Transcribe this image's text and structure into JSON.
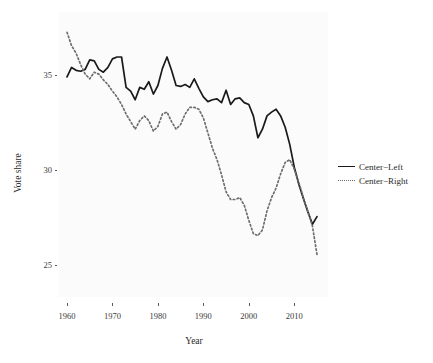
{
  "chart_data": {
    "type": "line",
    "title": "",
    "xlabel": "Year",
    "ylabel": "Vote share",
    "xlim": [
      1958,
      2016
    ],
    "ylim": [
      24.2,
      37.6
    ],
    "grid": false,
    "legend_position": "right",
    "xticks": [
      1960,
      1970,
      1980,
      1990,
      2000,
      2010
    ],
    "xtick_labels": [
      "1960",
      "1970",
      "1980",
      "1990",
      "2000",
      "2010"
    ],
    "yticks": [
      25,
      30,
      35
    ],
    "ytick_labels": [
      "25",
      "30",
      "35"
    ],
    "series": [
      {
        "name": "Center−Left",
        "style": "solid",
        "color": "#1a1a1a",
        "x": [
          1960,
          1961,
          1962,
          1963,
          1964,
          1965,
          1966,
          1967,
          1968,
          1969,
          1970,
          1971,
          1972,
          1973,
          1974,
          1975,
          1976,
          1977,
          1978,
          1979,
          1980,
          1981,
          1982,
          1983,
          1984,
          1985,
          1986,
          1987,
          1988,
          1989,
          1990,
          1991,
          1992,
          1993,
          1994,
          1995,
          1996,
          1997,
          1998,
          1999,
          2000,
          2001,
          2002,
          2003,
          2004,
          2005,
          2006,
          2007,
          2008,
          2009,
          2010,
          2011,
          2012,
          2013,
          2014,
          2015
        ],
        "y": [
          34.95,
          35.45,
          35.3,
          35.25,
          35.35,
          35.85,
          35.8,
          35.35,
          35.2,
          35.45,
          35.9,
          36.0,
          36.0,
          34.4,
          34.2,
          33.75,
          34.4,
          34.3,
          34.7,
          34.05,
          34.5,
          35.4,
          36.0,
          35.3,
          34.5,
          34.45,
          34.55,
          34.4,
          34.85,
          34.35,
          33.9,
          33.65,
          33.75,
          33.8,
          33.6,
          34.25,
          33.5,
          33.8,
          33.85,
          33.6,
          33.5,
          32.9,
          31.75,
          32.2,
          32.9,
          33.1,
          33.25,
          32.9,
          32.3,
          31.4,
          30.2,
          29.3,
          28.55,
          27.85,
          27.2,
          27.6
        ]
      },
      {
        "name": "Center−Right",
        "style": "dotted",
        "color": "#6e6e6e",
        "x": [
          1960,
          1961,
          1962,
          1963,
          1964,
          1965,
          1966,
          1967,
          1968,
          1969,
          1970,
          1971,
          1972,
          1973,
          1974,
          1975,
          1976,
          1977,
          1978,
          1979,
          1980,
          1981,
          1982,
          1983,
          1984,
          1985,
          1986,
          1987,
          1988,
          1989,
          1990,
          1991,
          1992,
          1993,
          1994,
          1995,
          1996,
          1997,
          1998,
          1999,
          2000,
          2001,
          2002,
          2003,
          2004,
          2005,
          2006,
          2007,
          2008,
          2009,
          2010,
          2011,
          2012,
          2013,
          2014,
          2015
        ],
        "y": [
          37.3,
          36.6,
          36.2,
          35.6,
          35.1,
          34.85,
          35.2,
          35.1,
          34.8,
          34.55,
          34.2,
          33.9,
          33.5,
          33.0,
          32.6,
          32.2,
          32.65,
          32.9,
          32.65,
          32.1,
          32.35,
          33.0,
          33.1,
          32.6,
          32.2,
          32.45,
          33.0,
          33.35,
          33.35,
          33.25,
          32.8,
          32.0,
          31.2,
          30.6,
          29.8,
          28.9,
          28.5,
          28.5,
          28.6,
          28.2,
          27.4,
          26.7,
          26.6,
          26.9,
          27.9,
          28.6,
          29.1,
          29.85,
          30.45,
          30.6,
          30.1,
          29.4,
          28.6,
          27.85,
          27.1,
          25.6
        ]
      }
    ]
  },
  "legend": {
    "items": [
      {
        "label": "Center−Left",
        "style": "solid"
      },
      {
        "label": "Center−Right",
        "style": "dotted"
      }
    ]
  },
  "axes": {
    "x_title": "Year",
    "y_title": "Vote share"
  },
  "colors": {
    "panel_background": "#fbfbfb",
    "page_background": "#ffffff",
    "center_left": "#1a1a1a",
    "center_right": "#6e6e6e",
    "text": "#2b2b2b",
    "tick": "#5a5a5a"
  }
}
